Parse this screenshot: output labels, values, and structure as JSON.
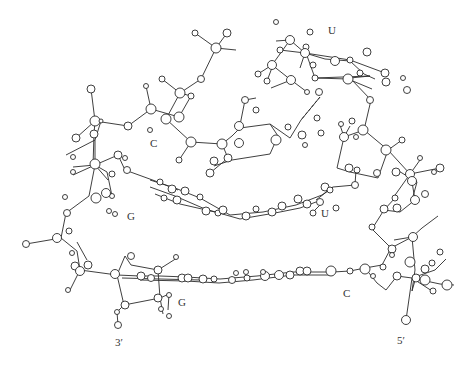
{
  "diagram": {
    "type": "ball-and-stick molecular structure",
    "labels": [
      {
        "id": "U-top",
        "text": "U",
        "x": 328,
        "y": 32
      },
      {
        "id": "C-left",
        "text": "C",
        "x": 150,
        "y": 140
      },
      {
        "id": "G-left",
        "text": "G",
        "x": 128,
        "y": 212
      },
      {
        "id": "U-mid",
        "text": "U",
        "x": 322,
        "y": 209
      },
      {
        "id": "G-bottom",
        "text": "G",
        "x": 180,
        "y": 298
      },
      {
        "id": "C-bottom",
        "text": "C",
        "x": 344,
        "y": 292
      },
      {
        "id": "3prime",
        "text": "3′",
        "x": 116,
        "y": 336
      },
      {
        "id": "5prime",
        "text": "5′",
        "x": 398,
        "y": 334
      }
    ]
  }
}
